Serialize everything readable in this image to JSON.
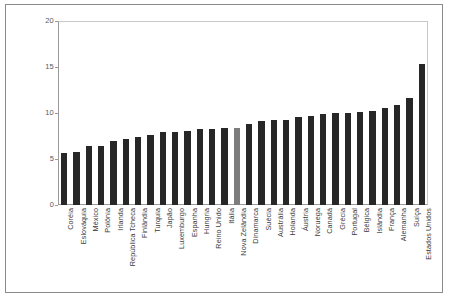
{
  "chart_data": {
    "type": "bar",
    "title": "",
    "subtitle": "",
    "xlabel": "",
    "ylabel": "",
    "ylim": [
      0,
      20
    ],
    "yticks": [
      "0",
      "5",
      "10",
      "15",
      "20"
    ],
    "ytick_values": [
      0,
      5,
      10,
      15,
      20
    ],
    "grid": false,
    "legend": "none",
    "orientation": "vertical",
    "bar_color": "#272727",
    "highlight_color": "#7d7d7d",
    "highlight_category": "Nova Zelândia",
    "categories": [
      "Coréia",
      "Eslováquia",
      "México",
      "Polônia",
      "Irlanda",
      "República Tcheca",
      "Finlândia",
      "Turquia",
      "Japão",
      "Luxemburgo",
      "Espanha",
      "Hungria",
      "Reino Unido",
      "Itália",
      "Nova Zelândia",
      "Dinamarca",
      "Suécia",
      "Austrália",
      "Holanda",
      "Áustria",
      "Noruega",
      "Canadá",
      "Grécia",
      "Portugal",
      "Bélgica",
      "Islândia",
      "França",
      "Alemanha",
      "Suíça",
      "Estados Unidos"
    ],
    "values": [
      5.6,
      5.8,
      6.4,
      6.4,
      7.0,
      7.2,
      7.4,
      7.6,
      7.9,
      7.9,
      8.0,
      8.3,
      8.3,
      8.4,
      8.4,
      8.8,
      9.1,
      9.2,
      9.2,
      9.6,
      9.7,
      9.9,
      10.0,
      10.0,
      10.1,
      10.2,
      10.5,
      10.9,
      11.6,
      15.3
    ]
  }
}
